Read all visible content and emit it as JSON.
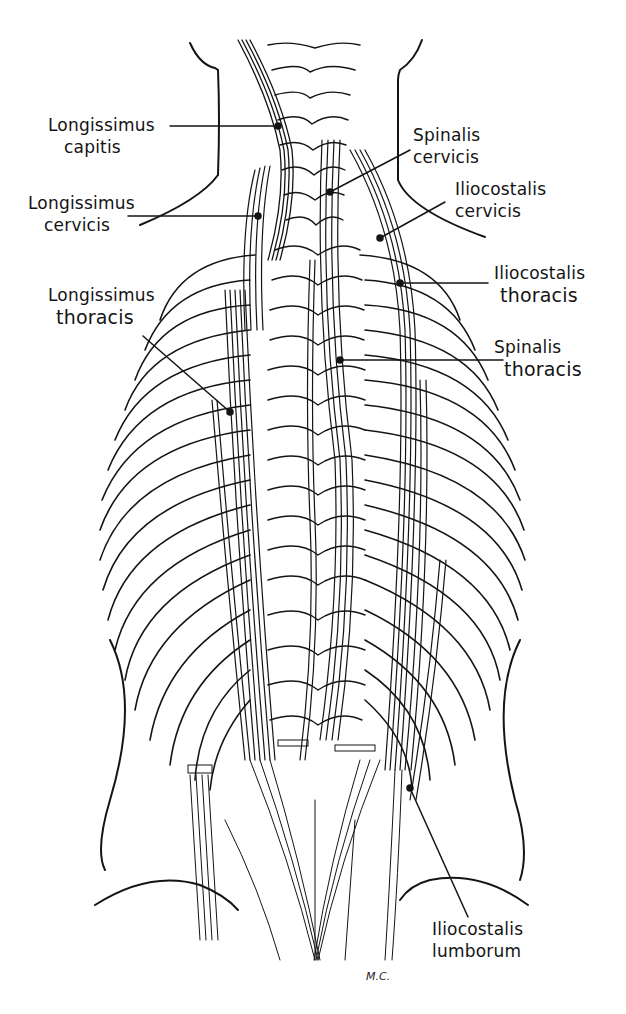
{
  "figure": {
    "artist_signature": "M.C.",
    "caption_faint": "Figure"
  },
  "labels": [
    {
      "id": "longissimus-capitis",
      "line1": "Longissimus",
      "line2": "capitis"
    },
    {
      "id": "longissimus-cervicis",
      "line1": "Longissimus",
      "line2": "cervicis"
    },
    {
      "id": "longissimus-thoracis",
      "line1": "Longissimus",
      "line2": "thoracis"
    },
    {
      "id": "spinalis-cervicis",
      "line1": "Spinalis",
      "line2": "cervicis"
    },
    {
      "id": "iliocostalis-cervicis",
      "line1": "Iliocostalis",
      "line2": "cervicis"
    },
    {
      "id": "iliocostalis-thoracis",
      "line1": "Iliocostalis",
      "line2": "thoracis"
    },
    {
      "id": "spinalis-thoracis",
      "line1": "Spinalis",
      "line2": "thoracis"
    },
    {
      "id": "iliocostalis-lumborum",
      "line1": "Iliocostalis",
      "line2": "lumborum"
    }
  ],
  "colors": {
    "ink": "#141414",
    "background": "#ffffff"
  }
}
